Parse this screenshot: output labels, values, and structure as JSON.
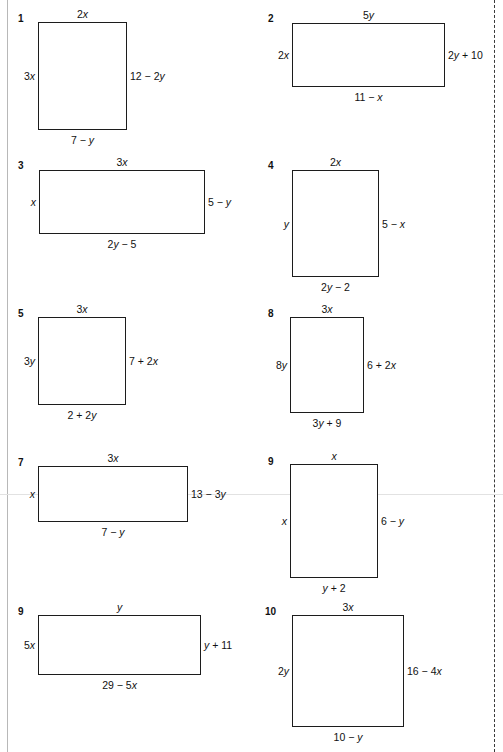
{
  "page": {
    "width": 503,
    "height": 752,
    "background": "#ffffff",
    "ink_color": "#1c1c1c",
    "left_rule_color": "#b8b8b8",
    "right_rule_color": "#3a3a3a",
    "scan_line_color": "#e2e2e2"
  },
  "problems": [
    {
      "number": "1",
      "num_x": 18,
      "num_y": 14,
      "rect": {
        "x": 38,
        "y": 22,
        "w": 89,
        "h": 108
      },
      "top": "2x",
      "left": "3x",
      "right": "12 − 2y",
      "bottom": "7 − y"
    },
    {
      "number": "2",
      "num_x": 268,
      "num_y": 14,
      "rect": {
        "x": 292,
        "y": 23,
        "w": 153,
        "h": 64
      },
      "top": "5y",
      "left": "2x",
      "right": "2y + 10",
      "bottom": "11 − x"
    },
    {
      "number": "3",
      "num_x": 18,
      "num_y": 161,
      "rect": {
        "x": 39,
        "y": 170,
        "w": 166,
        "h": 64
      },
      "top": "3x",
      "left": "x",
      "right": "5 − y",
      "bottom": "2y − 5"
    },
    {
      "number": "4",
      "num_x": 268,
      "num_y": 161,
      "rect": {
        "x": 292,
        "y": 170,
        "w": 87,
        "h": 107
      },
      "top": "2x",
      "left": "y",
      "right": "5 − x",
      "bottom": "2y − 2"
    },
    {
      "number": "5",
      "num_x": 18,
      "num_y": 309,
      "rect": {
        "x": 38,
        "y": 317,
        "w": 88,
        "h": 88
      },
      "top": "3x",
      "left": "3y",
      "right": "7 + 2x",
      "bottom": "2 + 2y"
    },
    {
      "number": "8",
      "num_x": 268,
      "num_y": 309,
      "rect": {
        "x": 290,
        "y": 317,
        "w": 74,
        "h": 96
      },
      "top": "3x",
      "left": "8y",
      "right": "6 + 2x",
      "bottom": "3y + 9"
    },
    {
      "number": "7",
      "num_x": 18,
      "num_y": 458,
      "rect": {
        "x": 38,
        "y": 466,
        "w": 150,
        "h": 56
      },
      "top": "3x",
      "left": "x",
      "right": "13 − 3y",
      "bottom": "7 − y"
    },
    {
      "number": "9",
      "num_x": 268,
      "num_y": 457,
      "rect": {
        "x": 290,
        "y": 464,
        "w": 88,
        "h": 114
      },
      "top": "x",
      "left": "x",
      "right": "6 − y",
      "bottom": "y + 2"
    },
    {
      "number": "9",
      "num_x": 18,
      "num_y": 607,
      "rect": {
        "x": 38,
        "y": 615,
        "w": 163,
        "h": 60
      },
      "top": "y",
      "left": "5x",
      "right": "y + 11",
      "bottom": "29 − 5x"
    },
    {
      "number": "10",
      "num_x": 265,
      "num_y": 607,
      "rect": {
        "x": 292,
        "y": 615,
        "w": 112,
        "h": 112
      },
      "top": "3x",
      "left": "2y",
      "right": "16 − 4x",
      "bottom": "10 − y"
    }
  ]
}
